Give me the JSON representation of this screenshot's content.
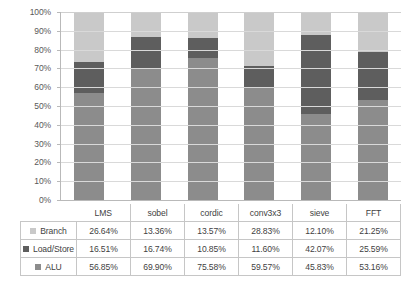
{
  "chart_data": {
    "type": "bar",
    "subtype": "stacked-percentage-column",
    "title": "",
    "xlabel": "",
    "ylabel": "",
    "ylim": [
      0,
      100
    ],
    "ytick_labels": [
      "100%",
      "90%",
      "80%",
      "70%",
      "60%",
      "50%",
      "40%",
      "30%",
      "20%",
      "10%",
      "0%"
    ],
    "ytick_values": [
      100,
      90,
      80,
      70,
      60,
      50,
      40,
      30,
      20,
      10,
      0
    ],
    "grid": true,
    "legend_position": "data-table-below",
    "categories": [
      "LMS",
      "sobel",
      "cordic",
      "conv3x3",
      "sieve",
      "FFT"
    ],
    "series": [
      {
        "name": "Branch",
        "color": "#c9c9c9",
        "values": [
          26.64,
          13.36,
          13.57,
          28.83,
          12.1,
          21.25
        ],
        "labels": [
          "26.64%",
          "13.36%",
          "13.57%",
          "28.83%",
          "12.10%",
          "21.25%"
        ]
      },
      {
        "name": "Load/Store",
        "color": "#5e5e5e",
        "values": [
          16.51,
          16.74,
          10.85,
          11.6,
          42.07,
          25.59
        ],
        "labels": [
          "16.51%",
          "16.74%",
          "10.85%",
          "11.60%",
          "42.07%",
          "25.59%"
        ]
      },
      {
        "name": "ALU",
        "color": "#8c8c8c",
        "values": [
          56.85,
          69.9,
          75.58,
          59.57,
          45.83,
          53.16
        ],
        "labels": [
          "56.85%",
          "69.90%",
          "75.58%",
          "59.57%",
          "45.83%",
          "53.16%"
        ]
      }
    ],
    "stack_order_bottom_to_top": [
      "ALU",
      "Load/Store",
      "Branch"
    ]
  }
}
